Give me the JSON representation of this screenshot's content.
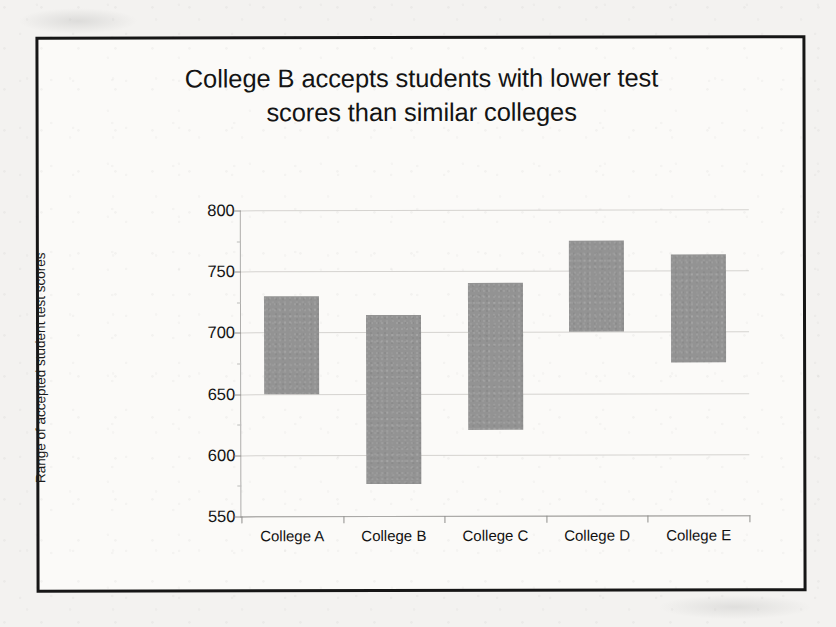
{
  "chart_data": {
    "type": "bar",
    "chart_style": "floating-range-bar",
    "title": "College B accepts students with lower test scores than similar colleges",
    "title_line1": "College B accepts students with lower test",
    "title_line2": "scores than similar colleges",
    "xlabel": "",
    "ylabel": "Range of accepted student test scores",
    "categories": [
      "College A",
      "College B",
      "College C",
      "College D",
      "College E"
    ],
    "ylim": [
      550,
      800
    ],
    "yticks": [
      550,
      600,
      650,
      700,
      750,
      800
    ],
    "ytick_labels": [
      "550",
      "600",
      "650",
      "700",
      "750",
      "800"
    ],
    "grid": true,
    "legend": false,
    "bar_color": "#939393",
    "series": [
      {
        "name": "Range of accepted student test scores",
        "low": [
          650,
          576,
          620,
          700,
          675
        ],
        "high": [
          730,
          714,
          740,
          775,
          763
        ]
      }
    ],
    "bars": [
      {
        "category": "College A",
        "low": 650,
        "high": 730
      },
      {
        "category": "College B",
        "low": 576,
        "high": 714
      },
      {
        "category": "College C",
        "low": 620,
        "high": 740
      },
      {
        "category": "College D",
        "low": 700,
        "high": 775
      },
      {
        "category": "College E",
        "low": 675,
        "high": 763
      }
    ]
  }
}
